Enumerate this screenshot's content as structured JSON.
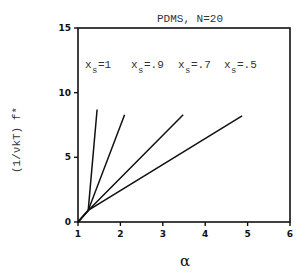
{
  "chart_data": {
    "type": "line",
    "title": "PDMS, N=20",
    "xlabel": "α",
    "ylabel": "(1/νkT)  f*",
    "xlim": [
      1,
      6
    ],
    "ylim": [
      0,
      15
    ],
    "xticks": [
      1,
      2,
      3,
      4,
      5,
      6
    ],
    "yticks": [
      0,
      5,
      10,
      15
    ],
    "grid": false,
    "legend": "inline-top",
    "series": [
      {
        "name": "x_s=1",
        "sub_label": "s",
        "label_main": "x",
        "label_suffix": "=1",
        "points": [
          [
            1.0,
            0.0
          ],
          [
            1.24,
            0.9
          ],
          [
            1.45,
            8.7
          ]
        ]
      },
      {
        "name": "x_s=.9",
        "sub_label": "s",
        "label_main": "x",
        "label_suffix": "=.9",
        "points": [
          [
            1.0,
            0.0
          ],
          [
            1.24,
            0.9
          ],
          [
            2.1,
            8.3
          ]
        ]
      },
      {
        "name": "x_s=.7",
        "sub_label": "s",
        "label_main": "x",
        "label_suffix": "=.7",
        "points": [
          [
            1.0,
            0.0
          ],
          [
            1.24,
            0.9
          ],
          [
            3.48,
            8.3
          ]
        ]
      },
      {
        "name": "x_s=.5",
        "sub_label": "s",
        "label_main": "x",
        "label_suffix": "=.5",
        "points": [
          [
            1.0,
            0.0
          ],
          [
            1.24,
            0.9
          ],
          [
            4.87,
            8.2
          ]
        ]
      }
    ],
    "line_color": "#111111"
  }
}
